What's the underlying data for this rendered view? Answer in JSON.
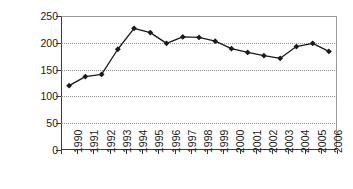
{
  "chart_data": {
    "type": "line",
    "title": "",
    "subtitle": "",
    "xlabel": "",
    "ylabel": "",
    "categories": [
      "1990",
      "1991",
      "1992",
      "1993",
      "1994",
      "1995",
      "1996",
      "1997",
      "1998",
      "1999",
      "2000",
      "2001",
      "2002",
      "2003",
      "2004",
      "2005",
      "2006"
    ],
    "values": [
      120,
      137,
      141,
      188,
      227,
      219,
      199,
      211,
      210,
      203,
      189,
      182,
      176,
      171,
      193,
      199,
      184
    ],
    "ylim": [
      0,
      250
    ],
    "ytick_labels": [
      "0",
      "50",
      "100",
      "150",
      "200",
      "250"
    ],
    "ytick_values": [
      0,
      50,
      100,
      150,
      200,
      250
    ],
    "grid": true,
    "legend": false,
    "legend_position": "none",
    "marker": "diamond",
    "line_color": "#1a1a1a",
    "marker_color": "#1a1a1a",
    "grid_color": "#8d8d8d",
    "axis_color": "#3a3a3a",
    "frame_color": "#9a9a9a",
    "background": "#ffffff"
  }
}
